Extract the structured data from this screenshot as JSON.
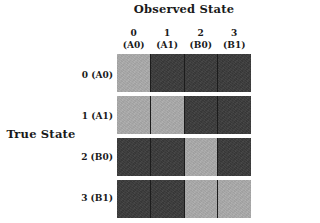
{
  "chart_data": {
    "type": "heatmap",
    "title": "",
    "xlabel": "Observed State",
    "ylabel": "True State",
    "categories_x": [
      "0 (A0)",
      "1 (A1)",
      "2 (B0)",
      "3 (B1)"
    ],
    "categories_y": [
      "0 (A0)",
      "1 (A1)",
      "2 (B0)",
      "3 (B1)"
    ],
    "x_tick_labels": [
      {
        "line1": "0",
        "line2": "(A0)"
      },
      {
        "line1": "1",
        "line2": "(A1)"
      },
      {
        "line1": "2",
        "line2": "(B0)"
      },
      {
        "line1": "3",
        "line2": "(B1)"
      }
    ],
    "y_tick_labels": [
      "0 (A0)",
      "1 (A1)",
      "2 (B0)",
      "3 (B1)"
    ],
    "values": [
      [
        1,
        0,
        0,
        0
      ],
      [
        1,
        1,
        0,
        0
      ],
      [
        0,
        0,
        1,
        0
      ],
      [
        0,
        0,
        1,
        1
      ]
    ],
    "value_scale": {
      "low": 0,
      "high": 1
    },
    "colors": {
      "low": "#3b3b3b",
      "high": "#ababab",
      "grid_line": "#1c1c1c",
      "background": "#ffffff",
      "text": "#1a1a1a"
    },
    "legend": "none",
    "grid": false
  },
  "axes": {
    "column_title": "Observed State",
    "row_title": "True State"
  }
}
